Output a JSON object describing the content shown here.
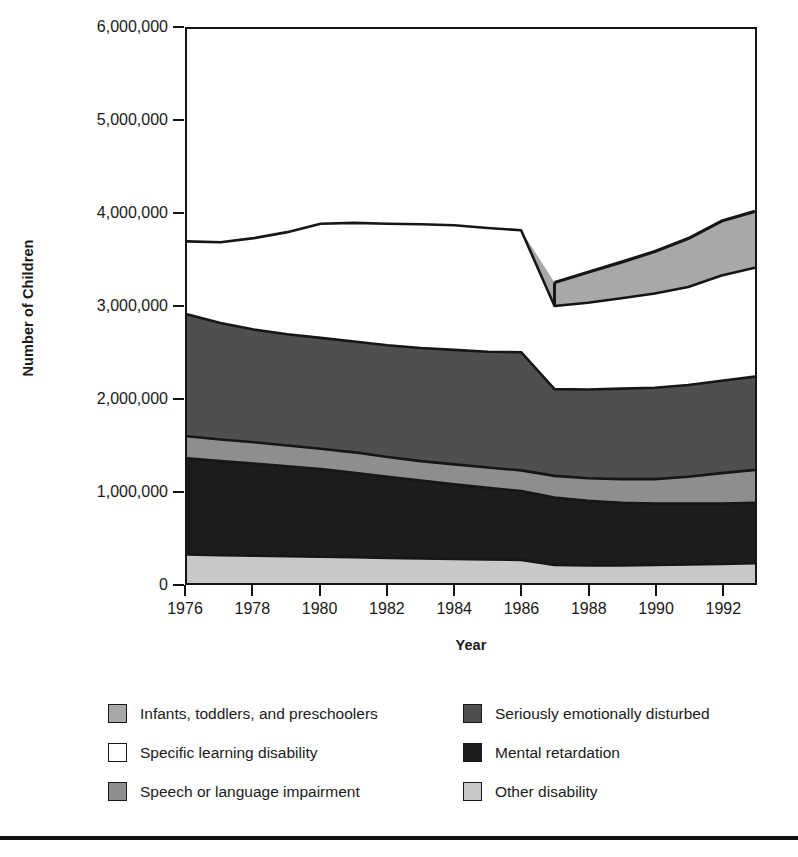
{
  "chart_data": {
    "type": "area",
    "stacked": true,
    "title": "",
    "xlabel": "Year",
    "ylabel": "Number of Children",
    "xlim": [
      1976,
      1993
    ],
    "ylim": [
      0,
      6000000
    ],
    "ytick_labels": [
      "0",
      "1,000,000",
      "2,000,000",
      "3,000,000",
      "4,000,000",
      "5,000,000",
      "6,000,000"
    ],
    "yticks": [
      0,
      1000000,
      2000000,
      3000000,
      4000000,
      5000000,
      6000000
    ],
    "xtick_labels": [
      "1976",
      "1978",
      "1980",
      "1982",
      "1984",
      "1986",
      "1988",
      "1990",
      "1992"
    ],
    "xticks": [
      1976,
      1978,
      1980,
      1982,
      1984,
      1986,
      1988,
      1990,
      1992
    ],
    "grid": false,
    "legend_position": "below",
    "x": [
      1976,
      1977,
      1978,
      1979,
      1980,
      1981,
      1982,
      1983,
      1984,
      1985,
      1986,
      1987,
      1988,
      1989,
      1990,
      1991,
      1992,
      1993
    ],
    "series": [
      {
        "name": "Other disability",
        "color": "#c8c8c8",
        "values": [
          310000,
          300000,
          295000,
          290000,
          285000,
          280000,
          270000,
          265000,
          260000,
          255000,
          250000,
          195000,
          190000,
          190000,
          195000,
          200000,
          205000,
          215000
        ]
      },
      {
        "name": "Mental retardation",
        "color": "#1c1c1c",
        "values": [
          1040000,
          1020000,
          1000000,
          975000,
          950000,
          915000,
          880000,
          845000,
          810000,
          775000,
          745000,
          730000,
          700000,
          680000,
          665000,
          660000,
          655000,
          655000
        ]
      },
      {
        "name": "Speech or language impairment",
        "color": "#8e8e8e",
        "values": [
          240000,
          235000,
          230000,
          225000,
          220000,
          220000,
          215000,
          210000,
          215000,
          220000,
          225000,
          235000,
          245000,
          255000,
          265000,
          290000,
          330000,
          355000
        ]
      },
      {
        "name": "Seriously emotionally disturbed",
        "color": "#4f4f4f",
        "values": [
          1320000,
          1260000,
          1220000,
          1205000,
          1200000,
          1200000,
          1210000,
          1225000,
          1240000,
          1255000,
          1280000,
          940000,
          960000,
          980000,
          990000,
          995000,
          1000000,
          1010000
        ]
      },
      {
        "name": "Specific learning disability",
        "color": "#ffffff",
        "values": [
          790000,
          875000,
          990000,
          1105000,
          1235000,
          1285000,
          1315000,
          1340000,
          1350000,
          1340000,
          1320000,
          900000,
          940000,
          980000,
          1020000,
          1060000,
          1140000,
          1180000
        ]
      },
      {
        "name": "Infants, toddlers, and preschoolers",
        "color": "#a8a8a8",
        "values": [
          0,
          0,
          0,
          0,
          0,
          0,
          0,
          0,
          0,
          0,
          0,
          255000,
          330000,
          390000,
          455000,
          525000,
          590000,
          610000
        ]
      }
    ]
  },
  "axes": {
    "y_title": "Number of Children",
    "x_title": "Year"
  },
  "legend": {
    "rows": [
      {
        "left": {
          "label": "Infants, toddlers, and preschoolers",
          "color": "#a8a8a8"
        },
        "right": {
          "label": "Seriously emotionally disturbed",
          "color": "#4f4f4f"
        }
      },
      {
        "left": {
          "label": "Specific learning disability",
          "color": "#ffffff"
        },
        "right": {
          "label": "Mental retardation",
          "color": "#1c1c1c"
        }
      },
      {
        "left": {
          "label": "Speech or language impairment",
          "color": "#8e8e8e"
        },
        "right": {
          "label": "Other disability",
          "color": "#c8c8c8"
        }
      }
    ]
  }
}
